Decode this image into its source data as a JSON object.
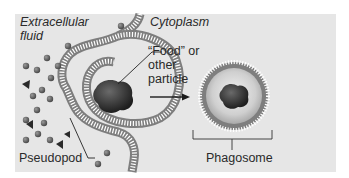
{
  "diagram": {
    "type": "phagocytosis-illustration",
    "colors": {
      "background_panel": "#e6e6e6",
      "membrane": "#8a8a8a",
      "particle": "#333333",
      "vesicle_interior": "#cfcfcf",
      "text": "#2a2a2a"
    },
    "labels": {
      "extracellular_line1": "Extracellular",
      "extracellular_line2": "fluid",
      "cytoplasm": "Cytoplasm",
      "food_line1": "“Food” or",
      "food_line2": "other",
      "food_line3": "particle",
      "pseudopod": "Pseudopod",
      "phagosome": "Phagosome"
    },
    "arrow": {
      "direction": "right",
      "meaning": "engulfment-to-phagosome"
    }
  }
}
